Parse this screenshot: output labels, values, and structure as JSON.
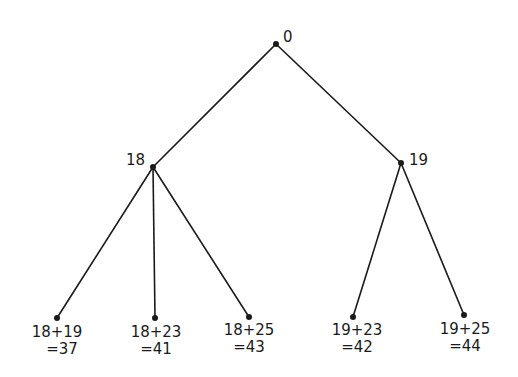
{
  "tree": {
    "root": {
      "label": "0",
      "x": 276,
      "y": 44
    },
    "level1": [
      {
        "label": "18",
        "x": 153,
        "y": 167
      },
      {
        "label": "19",
        "x": 401,
        "y": 163
      }
    ],
    "leaves": [
      {
        "parent": 0,
        "expr": "18+19",
        "result": "=37",
        "x": 57,
        "y": 318
      },
      {
        "parent": 0,
        "expr": "18+23",
        "result": "=41",
        "x": 155,
        "y": 318
      },
      {
        "parent": 0,
        "expr": "18+25",
        "result": "=43",
        "x": 249,
        "y": 317
      },
      {
        "parent": 1,
        "expr": "19+23",
        "result": "=42",
        "x": 353,
        "y": 317
      },
      {
        "parent": 1,
        "expr": "19+25",
        "result": "=44",
        "x": 464,
        "y": 315
      }
    ]
  },
  "colors": {
    "line": "#1a1a1a",
    "background": "#ffffff"
  }
}
